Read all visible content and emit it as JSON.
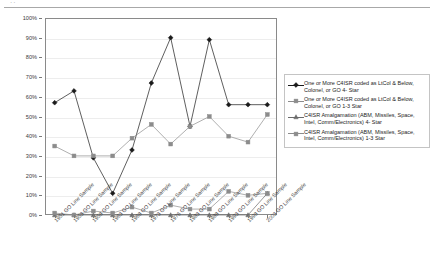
{
  "page": {
    "top_fragment": "..",
    "rule": "horizontal-rule"
  },
  "chart_data": {
    "type": "line",
    "title": "",
    "xlabel": "",
    "ylabel": "",
    "ylim": [
      0,
      100
    ],
    "ytick_labels": [
      "0%",
      "10%",
      "20%",
      "30%",
      "40%",
      "50%",
      "60%",
      "70%",
      "80%",
      "90%",
      "100%"
    ],
    "ytick_values": [
      0,
      10,
      20,
      30,
      40,
      50,
      60,
      70,
      80,
      90,
      100
    ],
    "grid": true,
    "legend_position": "right",
    "categories": [
      "1951 GO Line Sample",
      "1953 GO Line Sample",
      "1958 GO Line Sample",
      "1963 GO Line Sample",
      "1968 GO Line Sample",
      "1973 GO Line Sample",
      "1976 GO Line Sample",
      "1983 GO Line Sample",
      "1988 GO Line Sample",
      "1993 GO Line Sample",
      "1998 GO Line Sample",
      "2003 GO Line Sample"
    ],
    "series": [
      {
        "name": "One or More C4ISR coded as LtCol & Below, Colonel, or GO 4- Star",
        "marker": "diamond",
        "color": "#1a1a1a",
        "values": [
          57,
          63,
          29,
          11,
          33,
          67,
          90,
          45,
          89,
          56,
          56,
          56
        ]
      },
      {
        "name": "One or More C4ISR coded as LtCol & Below, Colonel, or GO 1-3 Star",
        "marker": "square",
        "color": "#8c8c8c",
        "values": [
          35,
          30,
          30,
          30,
          39,
          46,
          36,
          45,
          50,
          40,
          37,
          51
        ]
      },
      {
        "name": "C4ISR Amalgamation (ABM, Missiles, Space, Intel, Comm/Electronics) 4- Star",
        "marker": "triangle",
        "color": "#6b6b6b",
        "values": [
          0,
          0,
          0,
          0,
          0,
          0,
          0,
          0,
          0,
          0,
          0,
          11
        ]
      },
      {
        "name": "C4ISR Amalgamation (ABM, Missiles, Space, Intel, Comm/Electronics) 1-3 Star",
        "marker": "square",
        "color": "#8c8c8c",
        "values": [
          1,
          0,
          2,
          1,
          4,
          1,
          5,
          3,
          3,
          12,
          10,
          11
        ]
      }
    ]
  }
}
